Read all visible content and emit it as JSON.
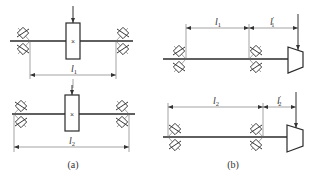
{
  "figure": {
    "panels": [
      {
        "id": "a",
        "caption": "(a)",
        "configurations": [
          {
            "description": "Gear/element mounted between two bearing supports",
            "span_label": "l",
            "span_subscript": "1",
            "load_marker": "×"
          },
          {
            "description": "Gear/element mounted between two bearing supports, wider span",
            "span_label": "l",
            "span_subscript": "2",
            "load_marker": "×"
          }
        ]
      },
      {
        "id": "b",
        "caption": "(b)",
        "configurations": [
          {
            "description": "Overhung bevel gear, short bearing span",
            "span_label": "l",
            "span_subscript": "1",
            "overhang_label": "l",
            "overhang_subscript": "1",
            "overhang_prime": "′"
          },
          {
            "description": "Overhung bevel gear, long bearing span",
            "span_label": "l",
            "span_subscript": "2",
            "overhang_label": "l",
            "overhang_subscript": "2",
            "overhang_prime": "′"
          }
        ]
      }
    ]
  },
  "colors": {
    "ink": "#333333",
    "background": "#ffffff"
  }
}
